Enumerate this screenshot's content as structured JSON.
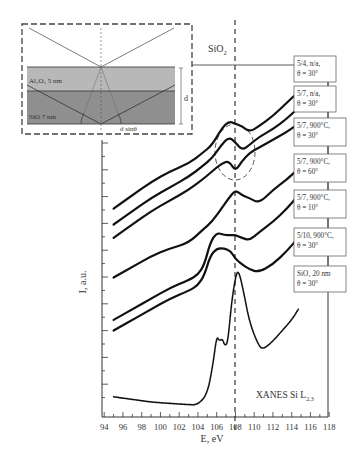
{
  "chart_data": {
    "type": "line",
    "title": "XANES Si L2,3",
    "xlabel": "E, eV",
    "ylabel": "I, a.u.",
    "xlim": [
      93.8,
      118.2
    ],
    "x_ticks": [
      94,
      96,
      98,
      100,
      102,
      104,
      106,
      108,
      110,
      112,
      114,
      116,
      118
    ],
    "grid": false,
    "reference_line": {
      "x": 108.1,
      "label": "SiO2",
      "style": "dashed"
    },
    "annotation_ellipse": {
      "x_center": 108.1,
      "around": "dips near 108 eV in 5/7 900°C curves"
    },
    "legend_position": "right, stacked labels connected to curve ends",
    "series": [
      {
        "name": "5/4, n/a, θ = 30°",
        "x": [
          95,
          97,
          99,
          101,
          103,
          104.5,
          105.5,
          106.5,
          107.3,
          108,
          108.7,
          109.5,
          110.5,
          112,
          113.5,
          114.7
        ],
        "y": [
          9.2,
          9.7,
          10.2,
          10.6,
          10.9,
          11.3,
          11.6,
          12.2,
          12.5,
          12.4,
          12.3,
          12.1,
          12.3,
          12.7,
          13.2,
          13.6
        ]
      },
      {
        "name": "5/7, n/a, θ = 30°",
        "x": [
          95,
          97,
          99,
          101,
          103,
          104.5,
          105.5,
          106.5,
          107.3,
          108,
          108.7,
          109.5,
          110.5,
          112,
          113.5,
          114.7
        ],
        "y": [
          8.6,
          9.1,
          9.6,
          10.0,
          10.4,
          10.8,
          11.1,
          11.6,
          11.9,
          11.7,
          11.4,
          11.6,
          11.9,
          12.2,
          12.6,
          13.0
        ]
      },
      {
        "name": "5/7, 900°C, θ = 30°",
        "x": [
          95,
          97,
          99,
          101,
          103,
          104.5,
          105.5,
          106.5,
          107.3,
          108,
          108.7,
          109.5,
          110.5,
          112,
          113.5,
          114.7
        ],
        "y": [
          8.1,
          8.6,
          9.1,
          9.5,
          9.9,
          10.3,
          10.6,
          10.9,
          11.0,
          10.6,
          11.0,
          11.3,
          11.5,
          11.8,
          12.1,
          12.4
        ]
      },
      {
        "name": "5/7, 900°C, θ = 60°",
        "x": [
          95,
          97,
          99,
          101,
          103,
          104.5,
          105.5,
          106.5,
          107.3,
          108,
          108.7,
          109.5,
          110.5,
          112,
          113.5,
          114.7
        ],
        "y": [
          6.6,
          7.0,
          7.4,
          7.7,
          7.9,
          8.4,
          8.7,
          9.2,
          9.6,
          9.9,
          9.7,
          9.6,
          9.4,
          9.9,
          10.3,
          10.7
        ]
      },
      {
        "name": "5/7, 900°C, θ = 10°",
        "x": [
          95,
          97,
          99,
          101,
          103,
          104,
          104.7,
          105.3,
          106,
          106.8,
          107.5,
          108,
          108.7,
          109.5,
          110.5,
          112,
          113.5,
          114.7
        ],
        "y": [
          5.0,
          5.4,
          5.8,
          6.2,
          6.5,
          6.7,
          7.1,
          7.9,
          8.3,
          8.2,
          8.2,
          8.2,
          8.1,
          8.0,
          8.3,
          8.7,
          9.2,
          9.7
        ]
      },
      {
        "name": "5/10, 900°C, θ = 30°",
        "x": [
          95,
          97,
          99,
          101,
          103,
          104,
          104.7,
          105.3,
          106,
          106.8,
          107.5,
          108,
          108.7,
          109.5,
          110.5,
          112,
          113.5,
          114.7
        ],
        "y": [
          4.6,
          5.0,
          5.4,
          5.8,
          6.1,
          6.3,
          6.7,
          7.4,
          7.7,
          7.7,
          7.6,
          7.3,
          7.1,
          6.9,
          6.8,
          7.1,
          7.6,
          8.1
        ]
      },
      {
        "name": "SiO2 20 nm, θ = 30°",
        "x": [
          95,
          97,
          99,
          101,
          103,
          104,
          105,
          105.6,
          106,
          106.3,
          106.6,
          106.9,
          107.2,
          107.6,
          108,
          108.3,
          108.8,
          109.5,
          110.5,
          111,
          112,
          113,
          114,
          114.7
        ],
        "y": [
          2.1,
          2.0,
          1.9,
          1.85,
          1.8,
          1.8,
          2.2,
          3.3,
          4.4,
          4.2,
          4.3,
          4.0,
          4.2,
          5.7,
          6.6,
          6.9,
          6.2,
          4.9,
          4.0,
          3.9,
          4.2,
          4.6,
          5.0,
          5.4
        ]
      }
    ]
  },
  "figure": {
    "ylabel": "I, a.u.",
    "xlabel": "E, eV",
    "corner_label_main": "XANES Si L",
    "corner_label_sub": "2,3",
    "ref_line_label_main": "SiO",
    "ref_line_label_sub": "2",
    "x_tick_labels": [
      "94",
      "96",
      "98",
      "100",
      "102",
      "104",
      "106",
      "108",
      "110",
      "112",
      "114",
      "116",
      "118"
    ],
    "legend_boxes": [
      {
        "line1": "5/4, n/a,",
        "line2": "θ = 30°"
      },
      {
        "line1": "5/7, n/a,",
        "line2": "θ = 30°"
      },
      {
        "line1": "5/7, 900°C,",
        "line2": "θ = 30°"
      },
      {
        "line1": "5/7, 900°C,",
        "line2": "θ = 60°"
      },
      {
        "line1": "5/7, 900°C,",
        "line2": "θ = 10°"
      },
      {
        "line1": "5/10, 900°C,",
        "line2": "θ = 30°"
      },
      {
        "line1": "SiO₂ 20 nm",
        "line2": "θ = 30°"
      }
    ],
    "inset": {
      "layer_top_label": "Al₂O₃ 5 nm",
      "layer_bottom_label": "SiO 7 nm",
      "thickness_label": "d",
      "path_label": "d sinθ"
    }
  }
}
